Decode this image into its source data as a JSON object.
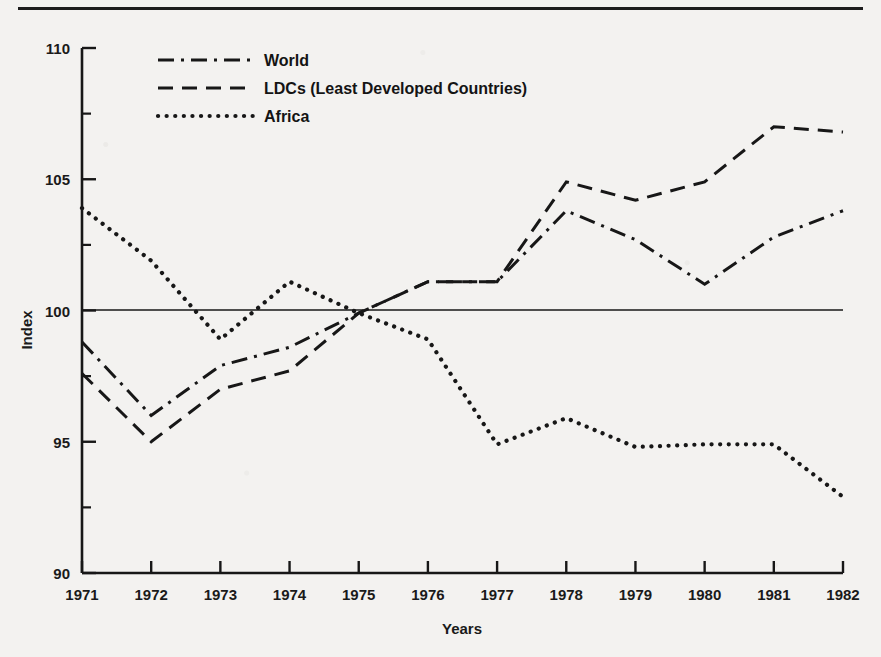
{
  "chart_data": {
    "type": "line",
    "title": "",
    "xlabel": "Years",
    "ylabel": "Index",
    "x": [
      1971,
      1972,
      1973,
      1974,
      1975,
      1976,
      1977,
      1978,
      1979,
      1980,
      1981,
      1982
    ],
    "xtick_labels": [
      "1971",
      "1972",
      "1973",
      "1974",
      "1975",
      "1976",
      "1977",
      "1978",
      "1979",
      "1980",
      "1981",
      "1982"
    ],
    "xlim": [
      1971,
      1982
    ],
    "ylim": [
      90,
      110
    ],
    "ytick_labels": [
      "90",
      "95",
      "100",
      "105",
      "110"
    ],
    "yticks": [
      90,
      95,
      100,
      105,
      110
    ],
    "yminor_ticks": [
      92.5,
      97.5,
      102.5,
      107.5
    ],
    "grid": false,
    "reference_line": 100,
    "legend_position": "top-center",
    "series": [
      {
        "name": "World",
        "style": "dash-dot",
        "color": "#171717",
        "values": [
          98.8,
          96.0,
          97.9,
          98.6,
          99.9,
          101.1,
          101.1,
          103.8,
          102.7,
          101.0,
          102.8,
          103.8
        ]
      },
      {
        "name": "LDCs (Least Developed Countries)",
        "style": "dashed",
        "color": "#171717",
        "values": [
          97.6,
          95.0,
          97.0,
          97.7,
          99.9,
          101.1,
          101.1,
          104.9,
          104.2,
          104.9,
          107.0,
          106.8
        ]
      },
      {
        "name": "Africa",
        "style": "dotted",
        "color": "#171717",
        "values": [
          103.9,
          101.9,
          98.9,
          101.1,
          99.9,
          98.9,
          94.9,
          95.9,
          94.8,
          94.9,
          94.9,
          92.9
        ]
      }
    ]
  },
  "legend": {
    "items": [
      {
        "label": "World",
        "style": "dash-dot"
      },
      {
        "label": "LDCs (Least Developed Countries)",
        "style": "dashed"
      },
      {
        "label": "Africa",
        "style": "dotted"
      }
    ]
  },
  "axes": {
    "y_title": "Index",
    "x_title": "Years"
  }
}
